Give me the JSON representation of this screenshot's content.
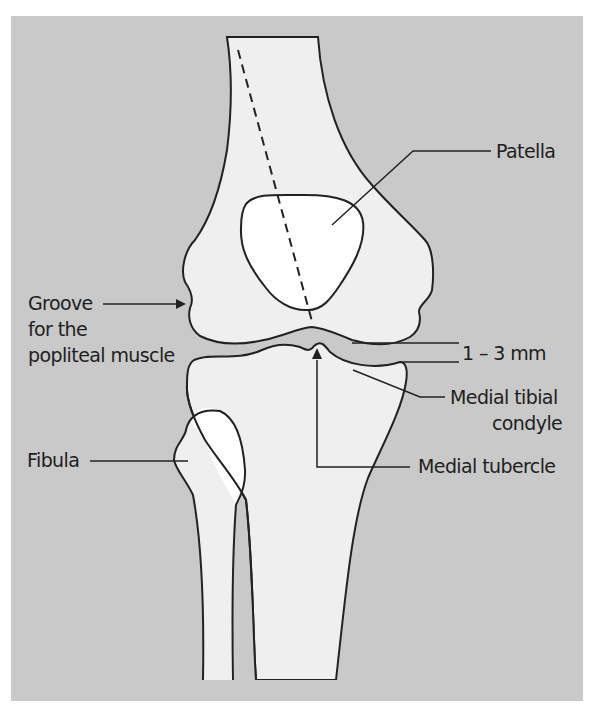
{
  "figure": {
    "colors": {
      "background": "#ffffff",
      "panel": "#c9c9c9",
      "bone": "#efefef",
      "patella": "#ffffff",
      "outline": "#222222"
    }
  },
  "labels": {
    "patella": "Patella",
    "groove_line1": "Groove",
    "groove_line2": "for the",
    "groove_line3": "popliteal muscle",
    "joint_space": "1 – 3 mm",
    "medial_tibial_line1": "Medial tibial",
    "medial_tibial_line2": "condyle",
    "fibula": "Fibula",
    "medial_tubercle": "Medial tubercle"
  }
}
